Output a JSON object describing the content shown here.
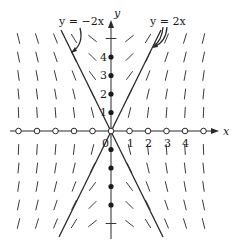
{
  "diagram": {
    "type": "slope-field",
    "axes": {
      "x_label": "x",
      "y_label": "y",
      "origin_label": "0",
      "x_tick_labels": [
        "1",
        "2",
        "3",
        "4"
      ],
      "y_tick_labels": [
        "1",
        "2",
        "3",
        "4"
      ],
      "x_range": [
        -5,
        5
      ],
      "y_range": [
        -5,
        5
      ]
    },
    "solution_curves": [
      {
        "label": "y = −2x",
        "slope": -2
      },
      {
        "label": "y = 2x",
        "slope": 2
      }
    ],
    "x_axis_markers": "open-circle",
    "y_axis_markers": "filled-dot",
    "field_slope_factor": 4,
    "grid_x": [
      -5,
      -4,
      -3,
      -2,
      -1,
      1,
      2,
      3,
      4,
      5
    ],
    "grid_y": [
      -5,
      -4,
      -3,
      -2,
      -1,
      1,
      2,
      3,
      4,
      5
    ]
  }
}
